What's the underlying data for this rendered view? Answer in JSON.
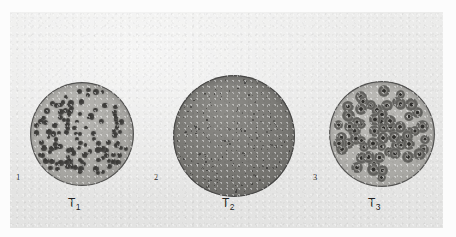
{
  "figure": {
    "type": "photographic-plate",
    "background_color": "#fcfcfc",
    "plate_color": "#e8e8e7"
  },
  "panels": [
    {
      "index_label": "1",
      "caption": "T",
      "caption_sub": "1",
      "name": "plate-t1",
      "dish": {
        "agar_tone": "#aeada9",
        "plaque_style": "solid-dark-dot",
        "plaque_count": 118,
        "plaque_size_px": [
          3.6,
          6.0
        ],
        "center": [
          72,
          122
        ],
        "radius": 52
      }
    },
    {
      "index_label": "2",
      "caption": "T",
      "caption_sub": "2",
      "name": "plate-t2",
      "dish": {
        "agar_tone": "#7e7d79",
        "plaque_style": "pinpoint-speck",
        "plaque_count": 260,
        "plaque_size_px": [
          0.8,
          1.8
        ],
        "center": [
          224,
          124
        ],
        "radius": 61
      }
    },
    {
      "index_label": "3",
      "caption": "T",
      "caption_sub": "3",
      "name": "plate-t3",
      "dish": {
        "agar_tone": "#b2b1ad",
        "plaque_style": "halo-ring",
        "plaque_count": 62,
        "plaque_size_px": [
          9.0,
          13.0
        ],
        "center": [
          372,
          122
        ],
        "radius": 53
      }
    }
  ],
  "chart_data": {
    "type": "table",
    "categories": [
      "T1",
      "T2",
      "T3"
    ],
    "series": [
      {
        "name": "Approximate plaque count per plate",
        "values": [
          118,
          260,
          62
        ]
      },
      {
        "name": "Approximate plaque diameter (px on plate)",
        "values": [
          5,
          1.5,
          11
        ]
      }
    ],
    "annotations": [
      "1",
      "2",
      "3"
    ],
    "legend": "none",
    "grid": false
  }
}
